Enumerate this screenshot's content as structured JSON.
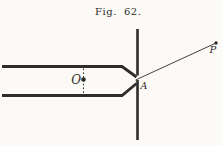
{
  "figure": {
    "title": "Fig. 62.",
    "labels": {
      "O": "O",
      "A": "A",
      "P": "P"
    }
  },
  "colors": {
    "background": "#fbfaf7",
    "ink": "#2f2d2a"
  }
}
